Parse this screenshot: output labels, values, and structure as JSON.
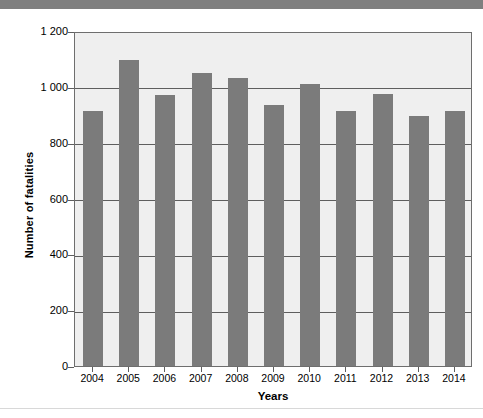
{
  "chart_data": {
    "type": "bar",
    "title": "",
    "subtitle": "",
    "xlabel": "Years",
    "ylabel": "Number of fatalities",
    "categories": [
      "2004",
      "2005",
      "2006",
      "2007",
      "2008",
      "2009",
      "2010",
      "2011",
      "2012",
      "2013",
      "2014"
    ],
    "values": [
      915,
      1095,
      970,
      1050,
      1030,
      935,
      1010,
      915,
      975,
      895,
      915
    ],
    "ylim": [
      0,
      1200
    ],
    "ytick_values": [
      0,
      200,
      400,
      600,
      800,
      1000,
      1200
    ],
    "ytick_labels": [
      "0",
      "200",
      "400",
      "600",
      "800",
      "1 000",
      "1 200"
    ],
    "grid": true,
    "grid_axis": "y",
    "legend": false,
    "legend_position": "none",
    "bar_color": "#7b7b7b",
    "plot_background": "#efefef",
    "axis_color": "#5e5e5e",
    "page_background": "#ffffff",
    "top_band_color": "#7f7f7f"
  },
  "axes": {
    "y_title": "Number of fatalities",
    "x_title": "Years"
  }
}
